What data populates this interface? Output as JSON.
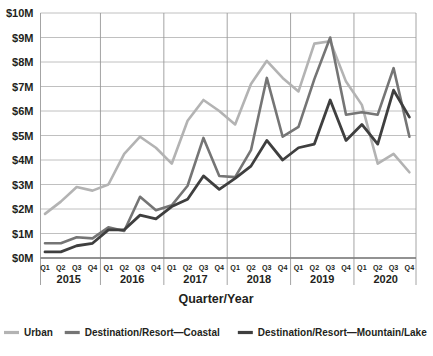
{
  "chart_data": {
    "type": "line",
    "title": "",
    "xlabel": "Quarter/Year",
    "ylabel": "",
    "ylim": [
      0,
      10
    ],
    "grid": true,
    "legend_position": "bottom",
    "y_tick_labels": [
      "$10M",
      "$9M",
      "$8M",
      "$7M",
      "$6M",
      "$5M",
      "$4M",
      "$3M",
      "$2M",
      "$1M",
      "$0M"
    ],
    "y_tick_values": [
      10,
      9,
      8,
      7,
      6,
      5,
      4,
      3,
      2,
      1,
      0
    ],
    "quarter_labels": [
      "Q1",
      "Q2",
      "Q3",
      "Q4"
    ],
    "years": [
      "2015",
      "2016",
      "2017",
      "2018",
      "2019",
      "2020"
    ],
    "categories": [
      "Q1 2015",
      "Q2 2015",
      "Q3 2015",
      "Q4 2015",
      "Q1 2016",
      "Q2 2016",
      "Q3 2016",
      "Q4 2016",
      "Q1 2017",
      "Q2 2017",
      "Q3 2017",
      "Q4 2017",
      "Q1 2018",
      "Q2 2018",
      "Q3 2018",
      "Q4 2018",
      "Q1 2019",
      "Q2 2019",
      "Q3 2019",
      "Q4 2019",
      "Q1 2020",
      "Q2 2020",
      "Q3 2020",
      "Q4 2020"
    ],
    "series": [
      {
        "name": "Urban",
        "color": "#b3b3b3",
        "values": [
          1.8,
          2.3,
          2.9,
          2.75,
          3.0,
          4.25,
          4.95,
          4.5,
          3.85,
          5.6,
          6.45,
          6.0,
          5.45,
          7.1,
          8.05,
          7.35,
          6.8,
          8.75,
          8.85,
          7.2,
          6.25,
          3.85,
          4.25,
          3.5
        ]
      },
      {
        "name": "Destination/Resort—Coastal",
        "color": "#757575",
        "values": [
          0.6,
          0.6,
          0.85,
          0.8,
          1.25,
          1.1,
          2.5,
          1.95,
          2.15,
          2.95,
          4.9,
          3.35,
          3.3,
          4.4,
          7.35,
          4.95,
          5.35,
          7.3,
          9.0,
          5.85,
          5.95,
          5.85,
          7.75,
          4.95
        ]
      },
      {
        "name": "Destination/Resort—Mountain/Lake",
        "color": "#3f3f3f",
        "values": [
          0.25,
          0.25,
          0.5,
          0.6,
          1.15,
          1.15,
          1.75,
          1.6,
          2.1,
          2.4,
          3.35,
          2.8,
          3.25,
          3.75,
          4.8,
          4.0,
          4.5,
          4.65,
          6.45,
          4.8,
          5.45,
          4.65,
          6.85,
          5.75
        ]
      }
    ]
  },
  "legend": {
    "items": [
      {
        "label": "Urban",
        "color": "#b3b3b3"
      },
      {
        "label": "Destination/Resort—Coastal",
        "color": "#757575"
      },
      {
        "label": "Destination/Resort—Mountain/Lake",
        "color": "#3f3f3f"
      }
    ]
  },
  "axis": {
    "x_title": "Quarter/Year"
  }
}
